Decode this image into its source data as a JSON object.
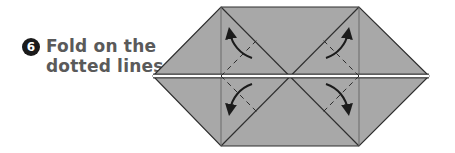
{
  "step": {
    "number": "6",
    "instruction_lines": [
      "Fold on the",
      "dotted lines."
    ]
  },
  "diagram": {
    "paper_color": "#a6a6a6",
    "line_color": "#2a2a2a",
    "arrows": [
      {
        "position": "upper-left",
        "direction": "up-left"
      },
      {
        "position": "lower-left",
        "direction": "down-left"
      },
      {
        "position": "upper-right",
        "direction": "up-right"
      },
      {
        "position": "lower-right",
        "direction": "down-right"
      }
    ]
  }
}
